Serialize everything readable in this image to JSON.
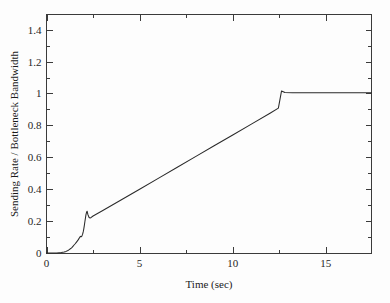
{
  "chart_data": {
    "type": "line",
    "title": "",
    "xlabel": "Time (sec)",
    "ylabel": "Sending Rate / Bottleneck Bandwidth",
    "xlim": [
      0,
      17.45
    ],
    "ylim": [
      0,
      1.495
    ],
    "grid": false,
    "legend": null,
    "x_ticks": [
      0,
      5,
      10,
      15
    ],
    "x_tick_labels": [
      "0",
      "5",
      "10",
      "15"
    ],
    "x_minor_ticks": [
      2.5,
      7.5,
      12.5,
      17.5
    ],
    "y_ticks": [
      0,
      0.2,
      0.4,
      0.6,
      0.8,
      1,
      1.2,
      1.4
    ],
    "y_tick_labels": [
      "0",
      "0.2",
      "0.4",
      "0.6",
      "0.8",
      "1",
      "1.2",
      "1.4"
    ],
    "y_minor_ticks": [
      0.1,
      0.3,
      0.5,
      0.7,
      0.9,
      1.1,
      1.3
    ],
    "line_color": "#2a2a2a",
    "series": [
      {
        "name": "sending rate ratio",
        "x": [
          0.0,
          0.55,
          0.8,
          0.95,
          1.05,
          1.15,
          1.22,
          1.3,
          1.36,
          1.42,
          1.48,
          1.54,
          1.6,
          1.66,
          1.7,
          1.74,
          1.78,
          1.82,
          1.86,
          1.9,
          1.94,
          1.97,
          2.0,
          2.03,
          2.06,
          2.09,
          2.12,
          2.15,
          2.18,
          2.22,
          2.28,
          2.34,
          2.4,
          2.5,
          3.0,
          4.0,
          5.0,
          6.0,
          7.0,
          8.0,
          9.0,
          10.0,
          11.0,
          12.0,
          12.45,
          12.62,
          12.8,
          13.2,
          14.0,
          15.0,
          16.0,
          17.0,
          17.45
        ],
        "y": [
          0.0,
          0.0,
          0.003,
          0.006,
          0.01,
          0.016,
          0.021,
          0.028,
          0.034,
          0.042,
          0.05,
          0.058,
          0.067,
          0.076,
          0.082,
          0.09,
          0.097,
          0.104,
          0.102,
          0.106,
          0.118,
          0.132,
          0.15,
          0.172,
          0.196,
          0.219,
          0.24,
          0.255,
          0.262,
          0.242,
          0.224,
          0.219,
          0.223,
          0.232,
          0.265,
          0.332,
          0.4,
          0.468,
          0.536,
          0.604,
          0.672,
          0.74,
          0.808,
          0.876,
          0.908,
          1.016,
          1.006,
          1.005,
          1.005,
          1.005,
          1.005,
          1.005,
          1.005
        ]
      }
    ]
  },
  "figure": {
    "background_color": "#fdfdfd",
    "axis_color": "#3b3b3b"
  }
}
